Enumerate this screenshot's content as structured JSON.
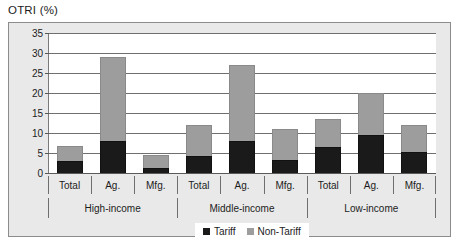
{
  "chart_data": {
    "type": "bar",
    "subtype": "stacked-bar",
    "title": "OTRI (%)",
    "xlabel": "",
    "ylabel": "",
    "ylim": [
      0,
      35
    ],
    "yticks": [
      0,
      5,
      10,
      15,
      20,
      25,
      30,
      35
    ],
    "grid": true,
    "legend_position": "bottom-center",
    "categories": [
      "Total",
      "Ag.",
      "Mfg.",
      "Total",
      "Ag.",
      "Mfg.",
      "Total",
      "Ag.",
      "Mfg."
    ],
    "groups": [
      {
        "label": "High-income",
        "categories": [
          "Total",
          "Ag.",
          "Mfg."
        ]
      },
      {
        "label": "Middle-income",
        "categories": [
          "Total",
          "Ag.",
          "Mfg."
        ]
      },
      {
        "label": "Low-income",
        "categories": [
          "Total",
          "Ag.",
          "Mfg."
        ]
      }
    ],
    "series": [
      {
        "name": "Tariff",
        "color": "#1a1a1a",
        "values": [
          3.0,
          8.0,
          1.3,
          4.3,
          8.0,
          3.3,
          6.5,
          9.5,
          5.3
        ]
      },
      {
        "name": "Non-Tariff",
        "color": "#9d9d9d",
        "values": [
          3.7,
          21.0,
          3.2,
          7.7,
          19.0,
          7.7,
          7.0,
          10.5,
          6.7
        ]
      }
    ],
    "totals": [
      6.7,
      29.0,
      4.5,
      12.0,
      27.0,
      11.0,
      13.5,
      20.0,
      12.0
    ]
  },
  "legend": {
    "items": [
      {
        "label": "Tariff",
        "swatch": "black-square-icon"
      },
      {
        "label": "Non-Tariff",
        "swatch": "gray-square-icon"
      }
    ]
  },
  "colors": {
    "tariff": "#1a1a1a",
    "non_tariff": "#9d9d9d",
    "panel_background": "#e9e9e9",
    "plot_background": "#ffffff",
    "gridline": "#6f6f6f",
    "border": "#8c8c8c",
    "text": "#1c1c1c"
  }
}
